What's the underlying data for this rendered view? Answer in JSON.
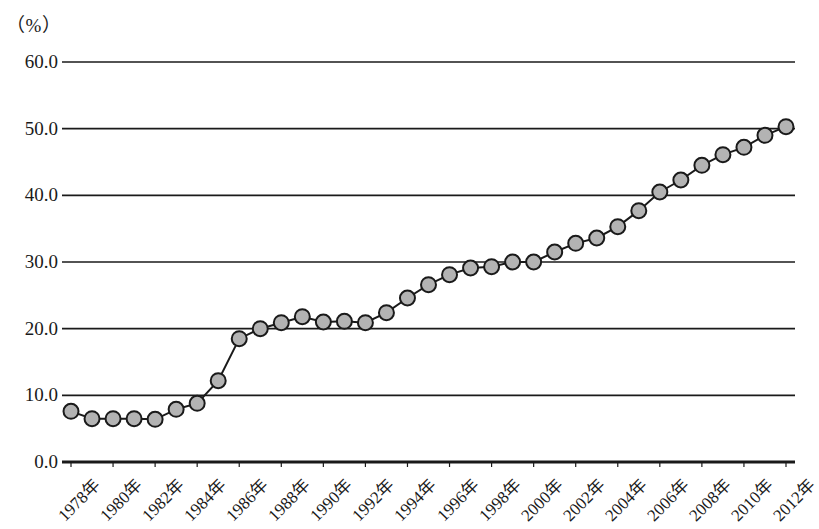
{
  "chart_data": {
    "type": "line",
    "title": "",
    "subtitle": "",
    "xlabel": "",
    "ylabel": "（%）",
    "unit_note": "（%）",
    "ylim": [
      0,
      60
    ],
    "y_ticks": [
      "0.0",
      "10.0",
      "20.0",
      "30.0",
      "40.0",
      "50.0",
      "60.0"
    ],
    "y_tick_values": [
      0,
      10,
      20,
      30,
      40,
      50,
      60
    ],
    "grid": true,
    "grid_axis": "y",
    "legend": null,
    "legend_position": "none",
    "marker": "circle",
    "marker_fill": "#b3b3b3",
    "marker_edge": "#1a1a1a",
    "line_color": "#1a1a1a",
    "x_tick_rotation": -45,
    "x_tick_interval": 2,
    "x": [
      "1978年",
      "1979年",
      "1980年",
      "1981年",
      "1982年",
      "1983年",
      "1984年",
      "1985年",
      "1986年",
      "1987年",
      "1988年",
      "1989年",
      "1990年",
      "1991年",
      "1992年",
      "1993年",
      "1994年",
      "1995年",
      "1996年",
      "1997年",
      "1998年",
      "1999年",
      "2000年",
      "2001年",
      "2002年",
      "2003年",
      "2004年",
      "2005年",
      "2006年",
      "2007年",
      "2008年",
      "2009年",
      "2010年",
      "2011年",
      "2012年"
    ],
    "x_tick_labels": [
      "1978年",
      "1980年",
      "1982年",
      "1984年",
      "1986年",
      "1988年",
      "1990年",
      "1992年",
      "1994年",
      "1996年",
      "1998年",
      "2000年",
      "2002年",
      "2004年",
      "2006年",
      "2008年",
      "2010年",
      "2012年"
    ],
    "values": [
      7.6,
      6.5,
      6.5,
      6.5,
      6.4,
      7.9,
      8.8,
      12.2,
      18.5,
      20.0,
      20.9,
      21.8,
      21.0,
      21.1,
      20.9,
      22.4,
      24.6,
      26.6,
      28.1,
      29.1,
      29.3,
      30.0,
      30.0,
      31.5,
      32.8,
      33.6,
      35.3,
      37.7,
      40.5,
      42.3,
      44.5,
      46.1,
      47.2,
      49.0,
      50.3
    ]
  }
}
